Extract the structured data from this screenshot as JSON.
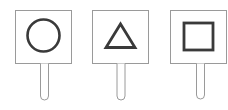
{
  "scene": {
    "description": "Three hand-held signs showing geometric shapes",
    "colors": {
      "background": "#ffffff",
      "board_stroke": "#9a9a9a",
      "shape_stroke": "#3a3a3a",
      "stick_stroke": "#9a9a9a"
    },
    "signs": [
      {
        "shape": "circle"
      },
      {
        "shape": "triangle"
      },
      {
        "shape": "square"
      }
    ]
  }
}
